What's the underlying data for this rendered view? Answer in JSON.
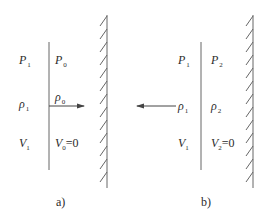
{
  "panels": [
    {
      "caption": "a)",
      "left": {
        "pressure": {
          "sym": "P",
          "sub": "1"
        },
        "density": {
          "sym": "ρ",
          "sub": "1"
        },
        "velocity": {
          "sym": "V",
          "sub": "1"
        }
      },
      "right": {
        "pressure": {
          "sym": "P",
          "sub": "0"
        },
        "density": {
          "sym": "ρ",
          "sub": "0"
        },
        "velocity": {
          "sym": "V",
          "sub": "0",
          "suffix": "=0"
        }
      },
      "arrow_direction": "right"
    },
    {
      "caption": "b)",
      "left": {
        "pressure": {
          "sym": "P",
          "sub": "1"
        },
        "density": {
          "sym": "ρ",
          "sub": "1"
        },
        "velocity": {
          "sym": "V",
          "sub": "1"
        }
      },
      "right": {
        "pressure": {
          "sym": "P",
          "sub": "2"
        },
        "density": {
          "sym": "ρ",
          "sub": "2"
        },
        "velocity": {
          "sym": "V",
          "sub": "2",
          "suffix": "=0"
        }
      },
      "arrow_direction": "left"
    }
  ],
  "colors": {
    "line": "#555555",
    "text": "#2b2b2b",
    "background": "#ffffff"
  }
}
